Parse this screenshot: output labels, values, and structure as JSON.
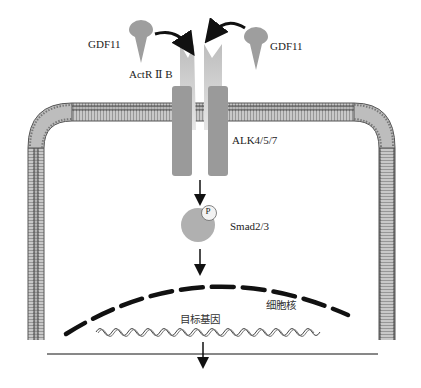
{
  "labels": {
    "ligand_left": "GDF11",
    "ligand_right": "GDF11",
    "receptor_type2": "ActR Ⅱ B",
    "receptor_type1": "ALK4/5/7",
    "phospho": "P",
    "smad": "Smad2/3",
    "nucleus": "细胞核",
    "target_gene": "目标基因"
  },
  "colors": {
    "membrane_fill": "#b8b8b8",
    "membrane_edge": "#555555",
    "receptor": "#9a9a9a",
    "receptor_light": "#d6d6d6",
    "ligand": "#9e9e9e",
    "smad": "#b0b0b0",
    "arrow": "#111111"
  }
}
